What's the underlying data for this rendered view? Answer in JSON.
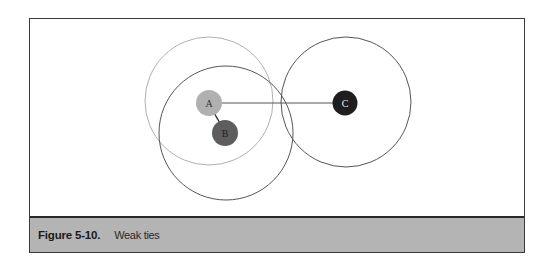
{
  "figure": {
    "label": "Figure 5-10.",
    "caption": "Weak ties"
  },
  "diagram": {
    "nodes": [
      {
        "id": "A",
        "label": "A",
        "fill": "#b0b0b0",
        "text_color": "#333333"
      },
      {
        "id": "B",
        "label": "B",
        "fill": "#5e5e5e",
        "text_color": "#222222"
      },
      {
        "id": "C",
        "label": "C",
        "fill": "#1e1e1e",
        "text_color": "#e8e8e8"
      }
    ],
    "edges": [
      {
        "from": "A",
        "to": "B",
        "type": "strong"
      },
      {
        "from": "A",
        "to": "C",
        "type": "weak"
      }
    ],
    "clusters": [
      {
        "around": "A",
        "stroke": "#b0b0b0"
      },
      {
        "around": "B",
        "stroke": "#555555"
      },
      {
        "around": "C",
        "stroke": "#555555"
      }
    ]
  },
  "colors": {
    "caption_bar": "#b4b4b4",
    "frame": "#3a3a3a"
  }
}
